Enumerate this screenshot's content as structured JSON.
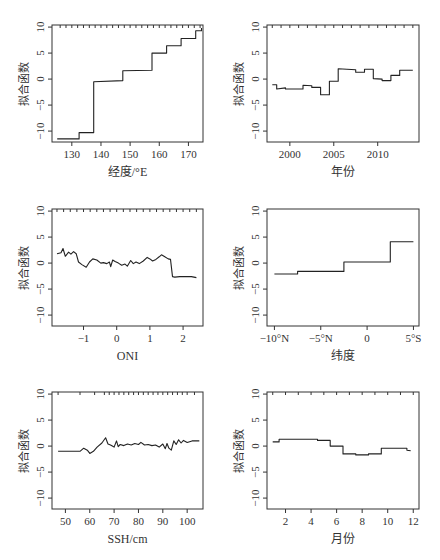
{
  "chart_data": [
    {
      "type": "line",
      "panel": "top-left",
      "xlabel": "经度/°E",
      "ylabel": "拟合函数",
      "xlim": [
        123.2,
        175.0
      ],
      "ylim": [
        -12.1,
        10.4
      ],
      "xticks": [
        130,
        140,
        150,
        160,
        170
      ],
      "xticklabels": [
        "130",
        "140",
        "150",
        "160",
        "170"
      ],
      "yticks": [
        -10,
        -5,
        0,
        5,
        10
      ],
      "yticklabels": [
        "−10",
        "−5",
        "0",
        "5",
        "10"
      ],
      "rug": [
        126,
        128,
        130,
        132,
        134,
        136,
        138,
        140,
        142,
        144,
        146,
        148,
        150,
        152,
        154,
        156,
        158,
        160,
        162,
        164,
        166,
        168,
        170,
        172,
        174
      ],
      "x": [
        125,
        132.5,
        132.5,
        137.5,
        137.5,
        147.5,
        147.5,
        157.5,
        157.5,
        162.5,
        162.5,
        167.5,
        167.5,
        172.5,
        172.5,
        174.5,
        174.5
      ],
      "y": [
        -11.5,
        -11.5,
        -10.3,
        -10.3,
        -0.5,
        -0.3,
        1.6,
        1.7,
        5.0,
        5.0,
        6.4,
        6.4,
        7.8,
        7.8,
        9.3,
        9.3,
        9.8
      ],
      "grid": false
    },
    {
      "type": "line",
      "panel": "top-right",
      "xlabel": "年份",
      "ylabel": "拟合函数",
      "xlim": [
        1997.4,
        2014.7
      ],
      "ylim": [
        -12.1,
        10.4
      ],
      "xticks": [
        2000,
        2005,
        2010
      ],
      "xticklabels": [
        "2000",
        "2005",
        "2010"
      ],
      "yticks": [
        -10,
        -5,
        0,
        5,
        10
      ],
      "yticklabels": [
        "−10",
        "−5",
        "0",
        "5",
        "10"
      ],
      "rug": [
        1998,
        1999,
        2000,
        2001,
        2002,
        2003,
        2004,
        2005,
        2006,
        2007,
        2008,
        2009,
        2010,
        2011,
        2012,
        2013,
        2014
      ],
      "x": [
        1998,
        1998.5,
        1998.5,
        1999.5,
        1999.5,
        2001.5,
        2001.5,
        2002.5,
        2002.5,
        2003.5,
        2003.5,
        2004.5,
        2004.5,
        2005.5,
        2005.5,
        2007.5,
        2007.5,
        2008.5,
        2008.5,
        2009.5,
        2009.5,
        2010.5,
        2010.5,
        2011.5,
        2011.5,
        2012.5,
        2012.5,
        2014
      ],
      "y": [
        -1.1,
        -1.1,
        -1.9,
        -1.7,
        -1.9,
        -1.9,
        -1.2,
        -1.3,
        -1.6,
        -1.6,
        -3.0,
        -3.0,
        -0.4,
        -0.4,
        2.0,
        1.8,
        1.3,
        1.3,
        1.9,
        1.9,
        0.1,
        0.0,
        -0.3,
        -0.3,
        0.7,
        0.7,
        1.7,
        1.7
      ],
      "grid": false
    },
    {
      "type": "line",
      "panel": "middle-left",
      "xlabel": "ONI",
      "ylabel": "拟合函数",
      "xlim": [
        -1.95,
        2.6
      ],
      "ylim": [
        -12.1,
        10.4
      ],
      "xticks": [
        -1,
        0,
        1,
        2
      ],
      "xticklabels": [
        "−1",
        "0",
        "1",
        "2"
      ],
      "yticks": [
        -10,
        -5,
        0,
        5,
        10
      ],
      "yticklabels": [
        "−10",
        "−5",
        "0",
        "5",
        "10"
      ],
      "rug": [
        -1.8,
        -1.6,
        -1.4,
        -1.2,
        -1.0,
        -0.8,
        -0.6,
        -0.4,
        -0.2,
        0.0,
        0.2,
        0.4,
        0.6,
        0.8,
        1.0,
        1.2,
        1.4,
        1.6,
        1.8,
        2.0,
        2.2,
        2.4
      ],
      "x": [
        -1.8,
        -1.68,
        -1.62,
        -1.55,
        -1.45,
        -1.38,
        -1.3,
        -1.22,
        -1.15,
        -1.05,
        -0.92,
        -0.82,
        -0.72,
        -0.6,
        -0.48,
        -0.4,
        -0.3,
        -0.22,
        -0.18,
        -0.12,
        -0.05,
        0.05,
        0.15,
        0.25,
        0.32,
        0.42,
        0.5,
        0.58,
        0.68,
        0.8,
        0.92,
        1.0,
        1.08,
        1.18,
        1.28,
        1.35,
        1.45,
        1.55,
        1.62,
        1.68,
        1.75,
        1.9,
        2.1,
        2.25,
        2.4
      ],
      "y": [
        1.8,
        2.0,
        2.8,
        1.3,
        2.1,
        1.7,
        2.2,
        1.8,
        0.2,
        -0.3,
        -0.8,
        0.2,
        0.8,
        0.6,
        0.0,
        0.1,
        -0.1,
        0.2,
        -0.7,
        0.6,
        0.3,
        0.0,
        -0.4,
        -0.2,
        -0.6,
        0.5,
        -0.1,
        0.2,
        -0.1,
        0.4,
        1.1,
        0.8,
        0.4,
        0.7,
        1.2,
        1.6,
        1.2,
        0.8,
        0.7,
        -2.6,
        -2.7,
        -2.6,
        -2.6,
        -2.6,
        -2.8
      ],
      "grid": false
    },
    {
      "type": "line",
      "panel": "middle-right",
      "xlabel": "纬度",
      "ylabel": "拟合函数",
      "xlim": [
        -10.8,
        5.6
      ],
      "ylim": [
        -12.1,
        10.4
      ],
      "xticks": [
        -10,
        -5,
        0,
        5
      ],
      "xticklabels": [
        "−10°N",
        "−5°N",
        "0",
        "5°S"
      ],
      "yticks": [
        -10,
        -5,
        0,
        5,
        10
      ],
      "yticklabels": [
        "−10",
        "−5",
        "0",
        "5",
        "10"
      ],
      "rug": [],
      "x": [
        -10,
        -7.5,
        -7.5,
        -2.5,
        -2.5,
        2.5,
        2.5,
        5
      ],
      "y": [
        -2.1,
        -2.1,
        -1.6,
        -1.6,
        0.2,
        0.2,
        4.1,
        4.1
      ],
      "grid": false
    },
    {
      "type": "line",
      "panel": "bottom-left",
      "xlabel": "SSH/cm",
      "ylabel": "拟合函数",
      "xlim": [
        44.5,
        106.5
      ],
      "ylim": [
        -12.1,
        10.4
      ],
      "xticks": [
        50,
        60,
        70,
        80,
        90,
        100
      ],
      "xticklabels": [
        "50",
        "60",
        "70",
        "80",
        "90",
        "100"
      ],
      "yticks": [
        -10,
        -5,
        0,
        5,
        10
      ],
      "yticklabels": [
        "−10",
        "−5",
        "0",
        "5",
        "10"
      ],
      "rug": [
        47,
        56,
        62,
        66,
        68,
        70,
        72,
        74,
        76,
        78,
        80,
        82,
        84,
        86,
        88,
        90,
        92,
        94,
        96,
        98,
        100,
        103
      ],
      "x": [
        47,
        56,
        57.5,
        59,
        60,
        61.5,
        63,
        65,
        66.5,
        67.5,
        68.5,
        70,
        71,
        71.7,
        72.5,
        74,
        75.5,
        77,
        78.5,
        80,
        81,
        82.5,
        84,
        85.5,
        87,
        88.5,
        90,
        91,
        91.7,
        92.5,
        93.5,
        94.5,
        95.5,
        96.5,
        97.5,
        98.5,
        100,
        102,
        105
      ],
      "y": [
        -1.0,
        -1.0,
        -0.4,
        -0.8,
        -1.4,
        -1.0,
        -0.2,
        0.6,
        1.6,
        0.4,
        0.2,
        -0.2,
        1.0,
        -0.1,
        0.3,
        0.1,
        0.4,
        0.2,
        0.5,
        0.3,
        0.7,
        0.2,
        0.3,
        0.1,
        0.2,
        -0.2,
        0.4,
        -0.5,
        0.5,
        -0.4,
        -0.8,
        1.0,
        0.3,
        1.2,
        0.6,
        1.1,
        0.7,
        1.0,
        1.0
      ],
      "grid": false
    },
    {
      "type": "line",
      "panel": "bottom-right",
      "xlabel": "月份",
      "ylabel": "拟合函数",
      "xlim": [
        0.55,
        12.45
      ],
      "ylim": [
        -12.1,
        10.4
      ],
      "xticks": [
        2,
        4,
        6,
        8,
        10,
        12
      ],
      "xticklabels": [
        "2",
        "4",
        "6",
        "8",
        "10",
        "12"
      ],
      "yticks": [
        -10,
        -5,
        0,
        5,
        10
      ],
      "yticklabels": [
        "−10",
        "−5",
        "0",
        "5",
        "10"
      ],
      "rug": [
        1,
        2,
        3,
        4,
        5,
        6,
        7,
        8,
        9,
        10,
        11,
        12
      ],
      "x": [
        1,
        1.5,
        1.5,
        4.5,
        4.5,
        5.5,
        5.5,
        6.5,
        6.5,
        7.5,
        7.5,
        8.5,
        8.5,
        9.5,
        9.5,
        11.5,
        11.5,
        11.8
      ],
      "y": [
        0.8,
        0.8,
        1.3,
        1.3,
        1.1,
        1.1,
        0.0,
        0.0,
        -1.5,
        -1.5,
        -1.7,
        -1.7,
        -1.5,
        -1.5,
        -0.4,
        -0.4,
        -0.8,
        -0.9
      ],
      "grid": false
    }
  ],
  "layout": {
    "panels": [
      {
        "left": 52,
        "top": 25,
        "right": 203,
        "bottom": 142
      },
      {
        "left": 267,
        "top": 25,
        "right": 419,
        "bottom": 142
      },
      {
        "left": 52,
        "top": 209,
        "right": 203,
        "bottom": 326
      },
      {
        "left": 267,
        "top": 209,
        "right": 419,
        "bottom": 326
      },
      {
        "left": 52,
        "top": 392,
        "right": 203,
        "bottom": 509
      },
      {
        "left": 267,
        "top": 392,
        "right": 419,
        "bottom": 509
      }
    ]
  }
}
